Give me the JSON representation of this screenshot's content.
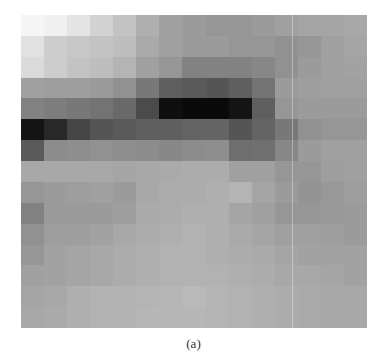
{
  "figure": {
    "caption": "(a)",
    "grid": {
      "rows": 15,
      "cols": 15,
      "gray_values": [
        [
          245,
          240,
          228,
          210,
          195,
          175,
          160,
          155,
          150,
          150,
          155,
          160,
          165,
          165,
          168
        ],
        [
          225,
          205,
          200,
          195,
          190,
          170,
          160,
          155,
          155,
          150,
          150,
          145,
          150,
          160,
          165
        ],
        [
          218,
          205,
          195,
          190,
          180,
          160,
          150,
          130,
          130,
          130,
          135,
          145,
          155,
          160,
          162
        ],
        [
          160,
          158,
          158,
          155,
          145,
          120,
          95,
          90,
          85,
          95,
          115,
          155,
          158,
          160,
          160
        ],
        [
          130,
          125,
          120,
          115,
          105,
          75,
          15,
          10,
          10,
          20,
          95,
          150,
          155,
          155,
          155
        ],
        [
          20,
          40,
          70,
          85,
          90,
          95,
          95,
          100,
          100,
          85,
          100,
          120,
          145,
          150,
          150
        ],
        [
          90,
          140,
          142,
          145,
          142,
          140,
          135,
          140,
          142,
          110,
          112,
          135,
          155,
          160,
          160
        ],
        [
          168,
          168,
          168,
          168,
          165,
          168,
          170,
          172,
          172,
          160,
          160,
          150,
          150,
          158,
          160
        ],
        [
          150,
          155,
          158,
          160,
          155,
          168,
          172,
          172,
          175,
          180,
          165,
          155,
          148,
          152,
          158
        ],
        [
          130,
          155,
          155,
          155,
          158,
          170,
          172,
          175,
          175,
          165,
          160,
          150,
          150,
          152,
          155
        ],
        [
          145,
          158,
          158,
          162,
          168,
          172,
          175,
          178,
          175,
          170,
          165,
          160,
          160,
          158,
          155
        ],
        [
          150,
          162,
          165,
          168,
          172,
          175,
          178,
          178,
          175,
          172,
          170,
          165,
          162,
          162,
          162
        ],
        [
          160,
          162,
          165,
          168,
          172,
          175,
          178,
          178,
          178,
          175,
          172,
          168,
          168,
          165,
          162
        ],
        [
          165,
          168,
          175,
          178,
          178,
          180,
          182,
          185,
          180,
          178,
          175,
          172,
          170,
          168,
          168
        ],
        [
          168,
          170,
          175,
          178,
          178,
          182,
          182,
          182,
          180,
          178,
          175,
          172,
          170,
          168,
          168
        ]
      ]
    }
  }
}
